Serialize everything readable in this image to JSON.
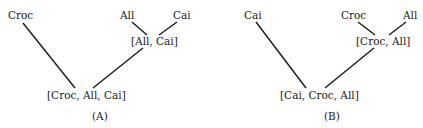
{
  "diagrams": {
    "a": {
      "caption": "(A)",
      "leaves": [
        "Croc",
        "All",
        "Cai"
      ],
      "inner_node": "[All, Cai]",
      "root": "[Croc, All, Cai]"
    },
    "b": {
      "caption": "(B)",
      "leaves": [
        "Cai",
        "Croc",
        "All"
      ],
      "inner_node": "[Croc, All]",
      "root": "[Cai, Croc, All]"
    }
  },
  "colors": {
    "line": "#1a1a1a",
    "text": "#1a1a1a",
    "background": "#ffffff"
  }
}
